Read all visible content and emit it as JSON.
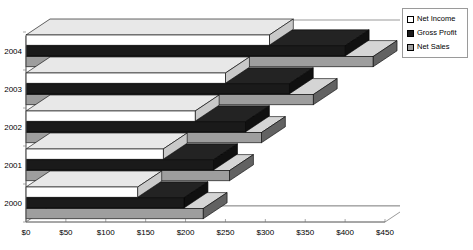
{
  "chart_data": {
    "type": "bar",
    "orientation": "horizontal",
    "style": "3d-clustered",
    "title": "",
    "xlabel": "",
    "ylabel": "",
    "categories": [
      "2000",
      "2001",
      "2002",
      "2003",
      "2004"
    ],
    "series": [
      {
        "name": "Net Income",
        "values": [
          140,
          172,
          212,
          250,
          305
        ],
        "color": "#ffffff"
      },
      {
        "name": "Gross Profit",
        "values": [
          198,
          235,
          275,
          330,
          400
        ],
        "color": "#1a1a1a"
      },
      {
        "name": "Net Sales",
        "values": [
          222,
          255,
          295,
          360,
          435
        ],
        "color": "#9e9e9e"
      }
    ],
    "xlim": [
      0,
      450
    ],
    "xticks": [
      0,
      50,
      100,
      150,
      200,
      250,
      300,
      350,
      400,
      450
    ],
    "xtick_labels": [
      "$0",
      "$50",
      "$100",
      "$150",
      "$200",
      "$250",
      "$300",
      "$350",
      "$400",
      "$450"
    ],
    "grid": false,
    "legend_position": "right",
    "currency_prefix": "$"
  },
  "legend": {
    "items": [
      {
        "label": "Net Income"
      },
      {
        "label": "Gross Profit"
      },
      {
        "label": "Net Sales"
      }
    ]
  },
  "colors": {
    "net_income": "#ffffff",
    "gross_profit": "#1a1a1a",
    "net_sales": "#9e9e9e",
    "axis": "#6e6e6e",
    "outline": "#000000",
    "background": "#ffffff"
  }
}
